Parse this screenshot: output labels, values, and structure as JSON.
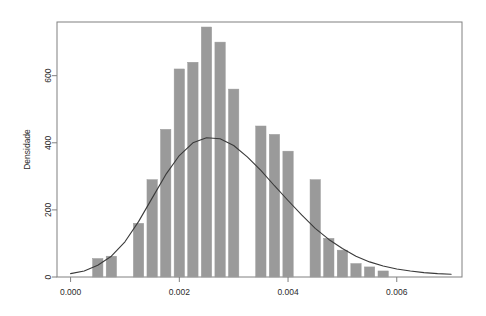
{
  "chart_data": {
    "type": "bar",
    "title": "",
    "subtitle": "",
    "xlabel": "",
    "ylabel": "Densidade",
    "xlim": [
      -0.00025,
      0.0072
    ],
    "ylim": [
      0,
      760
    ],
    "grid": false,
    "legend": null,
    "annotations": [],
    "bar_color": "#9a9a9a",
    "bar_edge_color": "#9a9a9a",
    "line_color": "#3a3a3a",
    "axis_color": "#808080",
    "x_tick_labels": [
      "0.000",
      "0.002",
      "0.004",
      "0.006"
    ],
    "x_tick_values": [
      0.0,
      0.002,
      0.004,
      0.006
    ],
    "y_tick_labels": [
      "0",
      "200",
      "400",
      "600"
    ],
    "y_tick_values": [
      0,
      200,
      400,
      600
    ],
    "bin_width": 0.00025,
    "categories": [
      "0.00050",
      "0.00075",
      "0.00100",
      "0.00125",
      "0.00150",
      "0.00175",
      "0.00200",
      "0.00225",
      "0.00250",
      "0.00275",
      "0.00300",
      "0.00325",
      "0.00350",
      "0.00375",
      "0.00400",
      "0.00425",
      "0.00450",
      "0.00475",
      "0.00500",
      "0.00525",
      "0.00550",
      "0.00575"
    ],
    "values": [
      55,
      62,
      0,
      160,
      290,
      440,
      620,
      640,
      745,
      700,
      560,
      0,
      450,
      425,
      375,
      0,
      290,
      115,
      80,
      40,
      30,
      18
    ],
    "bars": [
      {
        "x": 0.0005,
        "height": 55
      },
      {
        "x": 0.00075,
        "height": 62
      },
      {
        "x": 0.00125,
        "height": 160
      },
      {
        "x": 0.0015,
        "height": 290
      },
      {
        "x": 0.00175,
        "height": 440
      },
      {
        "x": 0.002,
        "height": 620
      },
      {
        "x": 0.00225,
        "height": 640
      },
      {
        "x": 0.0025,
        "height": 745
      },
      {
        "x": 0.00275,
        "height": 700
      },
      {
        "x": 0.003,
        "height": 560
      },
      {
        "x": 0.0035,
        "height": 450
      },
      {
        "x": 0.00375,
        "height": 425
      },
      {
        "x": 0.004,
        "height": 375
      },
      {
        "x": 0.0045,
        "height": 290
      },
      {
        "x": 0.00475,
        "height": 115
      },
      {
        "x": 0.005,
        "height": 80
      },
      {
        "x": 0.00525,
        "height": 40
      },
      {
        "x": 0.0055,
        "height": 30
      },
      {
        "x": 0.00575,
        "height": 18
      }
    ],
    "series": [
      {
        "name": "Densidade estimada",
        "type": "line",
        "x": [
          0.0,
          0.00025,
          0.0005,
          0.00075,
          0.001,
          0.00125,
          0.0015,
          0.00175,
          0.002,
          0.00225,
          0.0025,
          0.00275,
          0.003,
          0.00325,
          0.0035,
          0.00375,
          0.004,
          0.00425,
          0.0045,
          0.00475,
          0.005,
          0.00525,
          0.0055,
          0.00575,
          0.006,
          0.00625,
          0.0065,
          0.00675,
          0.007
        ],
        "values": [
          10,
          18,
          35,
          62,
          105,
          165,
          235,
          305,
          362,
          400,
          415,
          412,
          392,
          358,
          318,
          272,
          228,
          185,
          145,
          112,
          85,
          62,
          45,
          33,
          24,
          18,
          13,
          10,
          8
        ]
      }
    ]
  }
}
